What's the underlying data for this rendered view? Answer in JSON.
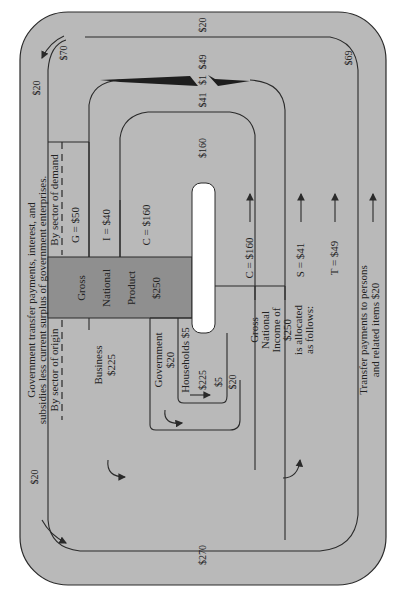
{
  "diagram": {
    "colors": {
      "background": "#ffffff",
      "panel": "#b9b9b9",
      "gnp_box": "#8f8f8f",
      "slot": "#ffffff",
      "line": "#2a2a2a"
    },
    "header": {
      "line1": "Government transfer payments, interest, and",
      "line2": "subsidies less current surplus of government enterprises."
    },
    "by_origin_label": "By sector of origin",
    "by_demand_label": "By sector of demand",
    "gnp": {
      "line1": "Gross",
      "line2": "National",
      "line3": "Product",
      "value": "$250"
    },
    "demand": {
      "g": "G = $50",
      "i": "I = $40",
      "c": "C = $160"
    },
    "origin": {
      "business_label": "Business",
      "business_value": "$225",
      "government_label": "Government",
      "government_value": "$20",
      "households_label": "Households  $5"
    },
    "gni": {
      "line1": "Gross",
      "line2": "National",
      "line3": "Income of",
      "line4": "$250",
      "line5": "is allocated",
      "line6": "as follows:"
    },
    "allocation": {
      "c": "C = $160",
      "s": "S = $41",
      "t": "T = $49"
    },
    "transfer": {
      "line1": "Transfer payments to persons",
      "line2": "and related items  $20"
    },
    "flow_values": {
      "outer_top_left": "$20",
      "outer_top_right": "$20",
      "outer_bottom_left": "$20",
      "seventy": "$70",
      "sixty_nine": "$69",
      "forty_nine": "$49",
      "one": "$1",
      "forty_one": "$41",
      "one_sixty": "$160",
      "two_seventy": "$270",
      "two_twenty_five": "$225",
      "five": "$5",
      "twenty_inner": "$20"
    }
  }
}
